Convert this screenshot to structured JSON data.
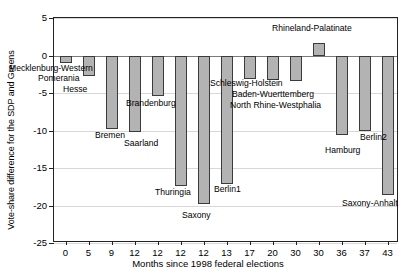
{
  "chart_data": {
    "type": "bar",
    "title": "",
    "xlabel": "Months since 1998 federal elections",
    "ylabel": "Vote-share difference for the SDP and Greens",
    "ylim": [
      -25,
      5
    ],
    "yticks": [
      5,
      0,
      -5,
      -10,
      -15,
      -20,
      -25
    ],
    "ytick_labels": [
      "5",
      "0",
      "-5",
      "-10",
      "-15",
      "-20",
      "-25"
    ],
    "grid": true,
    "legend": "none",
    "categories": [
      "0",
      "5",
      "9",
      "12",
      "12",
      "12",
      "12",
      "13",
      "17",
      "20",
      "30",
      "30",
      "36",
      "37",
      "43"
    ],
    "values": [
      -1.0,
      -2.7,
      -9.8,
      -10.2,
      -5.4,
      -17.4,
      -19.8,
      -17.1,
      -3.1,
      -3.3,
      -3.4,
      1.7,
      -10.6,
      -10.1,
      -18.6
    ],
    "point_labels": [
      "Mecklenburg-Western",
      "Pomerania",
      "Hesse",
      "Bremen",
      "Saarland",
      "Brandenburg",
      "Thuringia",
      "Saxony",
      "Berlin1",
      "Schleswig-Holstein",
      "Baden-Wuerttemberg",
      "North Rhine-Westphalia",
      "Rhineland-Palatinate",
      "Hamburg",
      "Berlin2",
      "Saxony-Anhalt"
    ],
    "annotations": [
      {
        "text": "Mecklenburg-Western",
        "x": 9,
        "y": 64
      },
      {
        "text": "Pomerania",
        "x": 38,
        "y": 74
      },
      {
        "text": "Hesse",
        "x": 63,
        "y": 85
      },
      {
        "text": "Bremen",
        "x": 95,
        "y": 131
      },
      {
        "text": "Saarland",
        "x": 124,
        "y": 139
      },
      {
        "text": "Brandenburg",
        "x": 126,
        "y": 99
      },
      {
        "text": "Thuringia",
        "x": 155,
        "y": 188
      },
      {
        "text": "Saxony",
        "x": 182,
        "y": 211
      },
      {
        "text": "Berlin1",
        "x": 214,
        "y": 185
      },
      {
        "text": "Schleswig-Holstein",
        "x": 210,
        "y": 79
      },
      {
        "text": "Baden-Wuerttemberg",
        "x": 232,
        "y": 90
      },
      {
        "text": "North Rhine-Westphalia",
        "x": 230,
        "y": 101
      },
      {
        "text": "Rhineland-Palatinate",
        "x": 272,
        "y": 24
      },
      {
        "text": "Hamburg",
        "x": 325,
        "y": 146
      },
      {
        "text": "Berlin2",
        "x": 360,
        "y": 133
      },
      {
        "text": "Saxony-Anhalt",
        "x": 342,
        "y": 199
      }
    ],
    "colors": {
      "bar_fill": "#b3b3b3",
      "bar_edge": "#3b3b3b",
      "grid": "#d8d8d8",
      "axis": "#222222",
      "background": "#ffffff"
    }
  }
}
